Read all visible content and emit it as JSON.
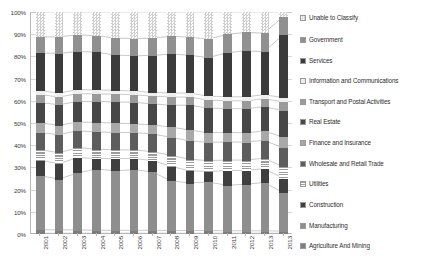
{
  "chart_data": {
    "type": "area",
    "title": "",
    "xlabel": "",
    "ylabel": "",
    "ylim": [
      0,
      100
    ],
    "grid": true,
    "legend_position": "right",
    "stacked": true,
    "normalized_percent": true,
    "categories": [
      "2001",
      "2002",
      "2003",
      "2004",
      "2005",
      "2006",
      "2007",
      "2008",
      "2009",
      "2010",
      "2011",
      "2012",
      "2013",
      "2013"
    ],
    "ytick_labels": [
      "100%",
      "90%",
      "80%",
      "70%",
      "60%",
      "50%",
      "40%",
      "30%",
      "20%",
      "10%",
      "0%"
    ],
    "ytick_values": [
      100,
      90,
      80,
      70,
      60,
      50,
      40,
      30,
      20,
      10,
      0
    ],
    "series": [
      {
        "name": "Agriculture And Mining",
        "color": "#7d7d7d",
        "pattern": "solid",
        "values": [
          1.6,
          1.5,
          1.5,
          1.4,
          1.3,
          1.3,
          1.3,
          1.2,
          1.2,
          1.2,
          1.1,
          1.1,
          1.1,
          1.0
        ]
      },
      {
        "name": "Manufacturing",
        "color": "#8e8e8e",
        "pattern": "solid",
        "values": [
          24.4,
          23.0,
          25.8,
          27.6,
          27.0,
          27.4,
          26.5,
          22.5,
          21.5,
          22.0,
          20.6,
          21.0,
          21.9,
          17.5
        ]
      },
      {
        "name": "Construction",
        "color": "#3f3f3f",
        "pattern": "solid",
        "values": [
          6.9,
          7.0,
          6.9,
          4.8,
          5.4,
          5.1,
          5.1,
          6.6,
          5.5,
          4.8,
          6.6,
          6.3,
          6.2,
          6.5
        ]
      },
      {
        "name": "Utilities",
        "color": "#9c9c9c",
        "pattern": "horizontal-lines",
        "values": [
          4.9,
          4.9,
          4.5,
          4.2,
          4.0,
          3.9,
          4.0,
          4.9,
          5.3,
          4.8,
          4.8,
          4.7,
          4.7,
          5.2
        ]
      },
      {
        "name": "Wholesale and Retail Trade",
        "color": "#5d5d5d",
        "pattern": "solid",
        "values": [
          7.7,
          8.2,
          7.6,
          7.8,
          7.9,
          7.8,
          8.0,
          8.2,
          8.3,
          8.3,
          8.2,
          8.1,
          8.1,
          8.5
        ]
      },
      {
        "name": "Finance and Insurance",
        "color": "#a8a8a8",
        "pattern": "solid",
        "values": [
          4.4,
          4.2,
          4.0,
          4.3,
          4.2,
          4.0,
          4.1,
          4.6,
          4.9,
          4.3,
          4.3,
          4.2,
          4.2,
          4.9
        ]
      },
      {
        "name": "Real Estate",
        "color": "#474747",
        "pattern": "solid",
        "values": [
          9.2,
          9.3,
          9.3,
          9.4,
          9.6,
          9.7,
          9.5,
          9.9,
          11.2,
          11.2,
          10.7,
          10.9,
          11.0,
          11.9
        ]
      },
      {
        "name": "Transport and Postal Activities",
        "color": "#9a9a9a",
        "pattern": "solid",
        "values": [
          3.6,
          3.5,
          3.5,
          3.5,
          3.5,
          3.4,
          3.5,
          3.7,
          3.7,
          3.6,
          3.6,
          3.6,
          3.6,
          3.9
        ]
      },
      {
        "name": "Information and Communications",
        "color": "#ededed",
        "pattern": "solid",
        "values": [
          1.8,
          1.8,
          1.8,
          1.8,
          1.7,
          1.7,
          1.7,
          1.8,
          1.8,
          1.8,
          1.8,
          1.8,
          1.8,
          2.0
        ]
      },
      {
        "name": "Services",
        "color": "#3b3b3b",
        "pattern": "solid",
        "values": [
          17.0,
          17.9,
          17.3,
          17.1,
          16.0,
          15.9,
          16.7,
          17.6,
          17.1,
          17.4,
          19.9,
          20.8,
          19.5,
          28.1
        ]
      },
      {
        "name": "Government",
        "color": "#909090",
        "pattern": "solid",
        "values": [
          7.3,
          7.5,
          7.5,
          7.4,
          7.7,
          7.8,
          7.9,
          8.0,
          8.2,
          8.3,
          8.3,
          8.3,
          8.4,
          8.2
        ]
      },
      {
        "name": "Unable to Classify",
        "color": "#cfcfcf",
        "pattern": "checker",
        "values": [
          11.2,
          11.2,
          10.3,
          10.7,
          11.7,
          12.0,
          11.7,
          11.0,
          11.3,
          12.3,
          10.1,
          9.2,
          9.5,
          2.3
        ]
      }
    ],
    "legend_entries": [
      {
        "label": "Unable to Classify",
        "color": "#cfcfcf",
        "pattern": "checker"
      },
      {
        "label": "Government",
        "color": "#909090",
        "pattern": "solid"
      },
      {
        "label": "Services",
        "color": "#3b3b3b",
        "pattern": "solid"
      },
      {
        "label": "Information and Communications",
        "color": "#ededed",
        "pattern": "solid"
      },
      {
        "label": "Transport and Postal Activities",
        "color": "#9a9a9a",
        "pattern": "solid"
      },
      {
        "label": "Real Estate",
        "color": "#474747",
        "pattern": "solid"
      },
      {
        "label": "Finance and Insurance",
        "color": "#a8a8a8",
        "pattern": "solid"
      },
      {
        "label": "Wholesale and Retail Trade",
        "color": "#5d5d5d",
        "pattern": "solid"
      },
      {
        "label": "Utilities",
        "color": "#9c9c9c",
        "pattern": "horizontal-lines"
      },
      {
        "label": "Construction",
        "color": "#3f3f3f",
        "pattern": "solid"
      },
      {
        "label": "Manufacturing",
        "color": "#8e8e8e",
        "pattern": "solid"
      },
      {
        "label": "Agriculture And Mining",
        "color": "#7d7d7d",
        "pattern": "solid"
      }
    ]
  }
}
